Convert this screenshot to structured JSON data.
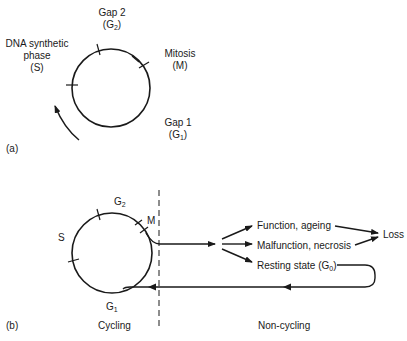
{
  "panel_a": {
    "tag": "(a)",
    "phases": {
      "g2": {
        "line1": "Gap 2",
        "line2_prefix": "(G",
        "line2_sub": "2",
        "line2_suffix": ")"
      },
      "s": {
        "line1": "DNA synthetic",
        "line2": "phase",
        "line3": "(S)"
      },
      "m": {
        "line1": "Mitosis",
        "line2": "(M)"
      },
      "g1": {
        "line1": "Gap 1",
        "line2_prefix": "(G",
        "line2_sub": "1",
        "line2_suffix": ")"
      }
    }
  },
  "panel_b": {
    "tag": "(b)",
    "phases": {
      "g2": {
        "base": "G",
        "sub": "2"
      },
      "s": "S",
      "m": "M",
      "g1": {
        "base": "G",
        "sub": "1"
      }
    },
    "outcomes": {
      "function": "Function, ageing",
      "malfunction": "Malfunction, necrosis",
      "resting_prefix": "Resting state (G",
      "resting_sub": "0",
      "resting_suffix": ")",
      "loss": "Loss"
    },
    "regions": {
      "cycling": "Cycling",
      "noncycling": "Non-cycling"
    }
  },
  "colors": {
    "line": "#1a1a1a",
    "background": "#ffffff"
  }
}
